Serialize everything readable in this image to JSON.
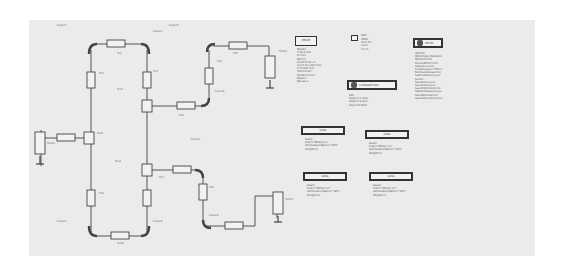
{
  "schematic": {
    "title": "Branch-line coupler schematic (ADS)",
    "components": {
      "term1": {
        "name": "Term1",
        "lines": [
          "Num=1",
          "Z=50 Ohm"
        ]
      },
      "term2": {
        "name": "Term2",
        "lines": [
          "Num=2",
          "Z=50 Ohm"
        ]
      },
      "term3": {
        "name": "Term3",
        "lines": [
          "Num=3",
          "Z=50 Ohm"
        ]
      },
      "tees": [
        {
          "name": "MTEE",
          "lines": [
            "Tee1",
            "Subst=\"MSub1\"",
            "W1=w1 mm",
            "W2=w2 mm",
            "W3=w3 mm"
          ]
        },
        {
          "name": "MTEE",
          "lines": [
            "Tee2",
            "Subst=\"MSub1\"",
            "W1=w1 mm",
            "W2=w2 mm",
            "W3=w3 mm"
          ]
        },
        {
          "name": "MTEE",
          "lines": [
            "Tee3",
            "Subst=\"MSub1\"",
            "W1=w1 mm",
            "W2=w2 mm",
            "W3=w3 mm"
          ]
        }
      ],
      "tlines": [
        {
          "name": "TL1",
          "lines": [
            "Subst=\"MSub1\"",
            "W=w mm",
            "L=l mm"
          ]
        },
        {
          "name": "TL2",
          "lines": [
            "Subst=\"MSub1\"",
            "W=w mm",
            "L=l mm"
          ]
        },
        {
          "name": "TL3",
          "lines": [
            "Subst=\"MSub1\"",
            "W=w mm",
            "L=l mm"
          ]
        },
        {
          "name": "TL4",
          "lines": [
            "Subst=\"MSub1\"",
            "W=w mm",
            "L=l mm"
          ]
        },
        {
          "name": "TL5",
          "lines": [
            "Subst=\"MSub1\"",
            "W=w mm",
            "L=l mm"
          ]
        },
        {
          "name": "TL6",
          "lines": [
            "Subst=\"MSub1\"",
            "W=w mm",
            "L=l mm"
          ]
        },
        {
          "name": "TL7",
          "lines": [
            "Subst=\"MSub1\"",
            "W=w mm",
            "L=l mm"
          ]
        },
        {
          "name": "TL8",
          "lines": [
            "Subst=\"MSub1\"",
            "W=w mm",
            "L=l mm"
          ]
        },
        {
          "name": "TL9",
          "lines": [
            "Subst=\"MSub1\"",
            "W=w mm",
            "L=l mm"
          ]
        },
        {
          "name": "TL10",
          "lines": [
            "Subst=\"MSub1\"",
            "W=w mm",
            "L=l mm"
          ]
        }
      ],
      "curves": [
        {
          "name": "Curve1",
          "lines": [
            "Subst=\"MSub1\"",
            "W=w mm",
            "Angle=90",
            "Radius=r mm",
            "Miter=1"
          ]
        },
        {
          "name": "Curve2",
          "lines": [
            "Subst=\"MSub1\"",
            "W=w mm",
            "Angle=90",
            "Radius=r mm",
            "Miter=1"
          ]
        },
        {
          "name": "Curve3",
          "lines": [
            "Subst=\"MSub1\"",
            "W=w mm",
            "Angle=90",
            "Radius=r mm",
            "Miter=1"
          ]
        },
        {
          "name": "Curve4",
          "lines": [
            "Subst=\"MSub1\"",
            "W=w mm",
            "Angle=90",
            "Radius=r mm",
            "Miter=1"
          ]
        },
        {
          "name": "Curve5",
          "lines": [
            "Subst=\"MSub1\"",
            "W=w mm",
            "Angle=90",
            "Radius=r mm",
            "Miter=1"
          ]
        },
        {
          "name": "Curve6",
          "lines": [
            "Subst=\"MSub1\"",
            "W=w mm",
            "Angle=90",
            "Radius=r mm",
            "Miter=1"
          ]
        },
        {
          "name": "Curve7",
          "lines": [
            "Subst=\"MSub1\"",
            "W=w mm",
            "Angle=90",
            "Radius=r mm",
            "Miter=1"
          ]
        },
        {
          "name": "Curve8",
          "lines": [
            "Subst=\"MSub1\"",
            "W=w mm",
            "Angle=90",
            "Radius=r mm",
            "Miter=1"
          ]
        }
      ]
    },
    "msub": {
      "title": "MSUB",
      "lines": [
        "MSub1",
        "H=0.8 mm",
        "Er=4.4",
        "Mur=1",
        "Cond=5.8E+7",
        "Hu=1.0e+033 mm",
        "T=0.035 mm",
        "TanD=0.02",
        "Rough=0 mm",
        "Bbase=",
        "Dpeaks="
      ]
    },
    "var": {
      "title": "VAR",
      "lines": [
        "VAR1",
        "w=1.53",
        "l=8.2",
        "r=2.5"
      ]
    },
    "sparam": {
      "title": "S-PARAMETERS",
      "lines": [
        "SP1",
        "Start=2.1 GHz",
        "Stop=2.6 GHz",
        "Step=10 MHz"
      ]
    },
    "optim": {
      "title": "OPTIM",
      "lines": [
        "Optim1",
        "OptimType=Random",
        "MaxIters=50",
        "DesiredError=0.0",
        "StatusLevel=4",
        "FinalAnalysis=\"None\"",
        "NormalizeGoals=no",
        "SetBestValues=yes",
        "Seed=",
        "SaveSolns=yes",
        "SaveGoals=yes",
        "SaveOptimVars=no",
        "UpdateDataset=yes",
        "SaveNominal=no",
        "SaveAllIterations=no"
      ],
      "lines2": [
        "UseAllOptVars=yes",
        "UseAllGoals=yes",
        "EnableCockpit=yes",
        "SaveAllTrials=no"
      ]
    },
    "goals": [
      {
        "title": "GOAL",
        "lines": [
          "Goal1",
          "Expr=\"dB(S(1,1))\"",
          "SimInstanceName=\"SP1\"",
          "Weight=1"
        ]
      },
      {
        "title": "GOAL",
        "lines": [
          "Goal2",
          "Expr=\"dB(S(2,1))\"",
          "SimInstanceName=\"SP1\"",
          "Weight=1"
        ]
      },
      {
        "title": "GOAL",
        "lines": [
          "Goal3",
          "Expr=\"dB(S(3,1))\"",
          "SimInstanceName=\"SP1\"",
          "Weight=1"
        ]
      },
      {
        "title": "GOAL",
        "lines": [
          "Goal4",
          "Expr=\"dB(S(2,3))\"",
          "SimInstanceName=\"SP1\"",
          "Weight=1"
        ]
      }
    ],
    "colors": {
      "background": "#ebebeb",
      "wire": "#444444",
      "text": "#555555"
    }
  }
}
